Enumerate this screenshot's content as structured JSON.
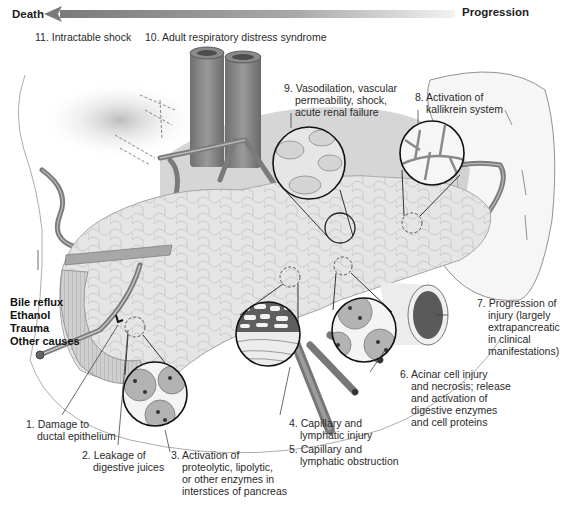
{
  "header": {
    "left_label": "Death",
    "right_label": "Progression",
    "arrow_direction": "right-to-left"
  },
  "causes": {
    "items": [
      "Bile reflux",
      "Ethanol",
      "Trauma",
      "Other causes"
    ]
  },
  "steps": [
    {
      "number": "1.",
      "lines": [
        "Damage to",
        "ductal epithelium"
      ]
    },
    {
      "number": "2.",
      "lines": [
        "Leakage of",
        "digestive juices"
      ]
    },
    {
      "number": "3.",
      "lines": [
        "Activation of",
        "proteolytic, lipolytic,",
        "or other enzymes in",
        "interstices of pancreas"
      ]
    },
    {
      "number": "4.",
      "lines": [
        "Capillary and",
        "lymphatic injury"
      ]
    },
    {
      "number": "5.",
      "lines": [
        "Capillary and",
        "lymphatic obstruction"
      ]
    },
    {
      "number": "6.",
      "lines": [
        "Acinar cell injury",
        "and necrosis; release",
        "and activation of",
        "digestive enzymes",
        "and cell proteins"
      ]
    },
    {
      "number": "7.",
      "lines": [
        "Progression of",
        "injury (largely",
        "extrapancreatic",
        "in clinical",
        "manifestations)"
      ]
    },
    {
      "number": "8.",
      "lines": [
        "Activation of",
        "kallikrein system"
      ]
    },
    {
      "number": "9.",
      "lines": [
        "Vasodilation, vascular",
        "permeability, shock,",
        "acute renal failure"
      ]
    },
    {
      "number": "10.",
      "lines": [
        "Adult respiratory distress syndrome"
      ]
    },
    {
      "number": "11.",
      "lines": [
        "Intractable shock"
      ]
    }
  ],
  "colors": {
    "arrow_dark": "#7a7a7a",
    "vessel": "#8a8a8a",
    "vessel_dark": "#5e5e5e",
    "pancreas": "#d9d9d9",
    "pancreas_line": "#a8a8a8",
    "outline": "#222222",
    "cell": "#b3b3b3",
    "nucleus": "#3a3a3a"
  }
}
